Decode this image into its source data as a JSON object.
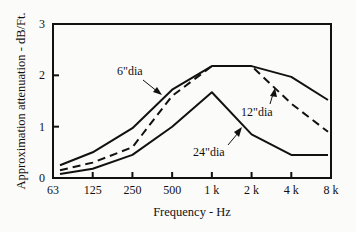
{
  "chart_data": {
    "type": "line",
    "title": "",
    "xlabel": "Frequency - Hz",
    "ylabel": "Approximation attenuation - dB/Ft.",
    "categories": [
      "63",
      "125",
      "250",
      "500",
      "1 k",
      "2 k",
      "4 k",
      "8 k"
    ],
    "yticks": [
      "0",
      "1",
      "2",
      "3"
    ],
    "ylim": [
      0,
      3
    ],
    "grid": false,
    "legend": "none (inline annotations)",
    "series": [
      {
        "name": "6\"dia",
        "style": "solid",
        "values": [
          0.25,
          0.5,
          0.97,
          1.72,
          2.18,
          2.18,
          1.97,
          1.52
        ]
      },
      {
        "name": "12\"dia",
        "style": "dashed",
        "values": [
          0.15,
          0.3,
          0.6,
          1.6,
          2.18,
          2.18,
          1.45,
          0.9
        ]
      },
      {
        "name": "24\"dia",
        "style": "solid",
        "values": [
          0.08,
          0.18,
          0.45,
          1.0,
          1.67,
          0.85,
          0.45,
          0.45
        ]
      }
    ],
    "annotations": [
      {
        "text": "6\"dia",
        "points_to": "6\"dia curve near 500 Hz"
      },
      {
        "text": "12\"dia",
        "points_to": "12\"dia dashed curve near 3 kHz"
      },
      {
        "text": "24\"dia",
        "points_to": "24\"dia curve near 1.6 kHz"
      }
    ]
  }
}
